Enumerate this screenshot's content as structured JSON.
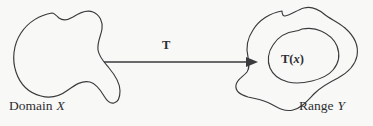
{
  "figure": {
    "type": "set-mapping-diagram",
    "background_color": "#f8f8f7",
    "stroke_color": "#3a3a3c",
    "text_color": "#2e2e30",
    "width": 373,
    "height": 126
  },
  "labels": {
    "domain_word": "Domain",
    "domain_var": "X",
    "range_word": "Range",
    "range_var": "Y",
    "map_name": "T",
    "image_func": "T",
    "image_open": "(",
    "image_arg": "x",
    "image_close": ")"
  },
  "shapes": {
    "domain_blob": {
      "name": "domain-blob",
      "label": "Domain X"
    },
    "range_outer_blob": {
      "name": "range-outer-blob",
      "label": "Range Y"
    },
    "range_inner_blob": {
      "name": "image-inner-blob",
      "label": "T(x)"
    }
  },
  "arrow": {
    "name": "transformation-arrow",
    "from": "domain-blob",
    "to": "image-inner-blob",
    "label": "T",
    "start_x": 104,
    "start_y": 62,
    "end_x": 258,
    "end_y": 62
  }
}
